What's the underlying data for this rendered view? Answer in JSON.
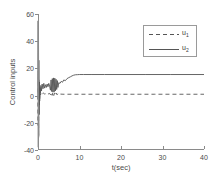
{
  "chart_data": {
    "type": "line",
    "title": "",
    "xlabel": "t(sec)",
    "ylabel": "Control inputs",
    "xlim": [
      0,
      40
    ],
    "ylim": [
      -40,
      60
    ],
    "xticks": [
      "0",
      "10",
      "20",
      "30",
      "40"
    ],
    "xtick_values": [
      0,
      10,
      20,
      30,
      40
    ],
    "yticks": [
      "-40",
      "-20",
      "0",
      "20",
      "40",
      "60"
    ],
    "ytick_values": [
      -40,
      -20,
      0,
      20,
      40,
      60
    ],
    "grid": false,
    "legend_position": "upper right",
    "series": [
      {
        "name": "u_1",
        "label": "u",
        "sublabel": "1",
        "style": "dashed",
        "color": "#555555",
        "steady_state": 1.0,
        "x": [
          0,
          0.05,
          0.1,
          0.15,
          0.2,
          0.25,
          0.3,
          0.4,
          0.5,
          0.6,
          0.8,
          1.0,
          1.3,
          1.6,
          2.0,
          2.4,
          2.8,
          3.0,
          3.2,
          3.4,
          3.6,
          3.8,
          4.0,
          4.2,
          4.4,
          4.6,
          4.8,
          5.0,
          5.4,
          6.0,
          7.0,
          8.0,
          10.0,
          14.0,
          20.0,
          28.0,
          34.0,
          40.0
        ],
        "y": [
          0,
          -22,
          18,
          -31,
          12,
          -8,
          5,
          -3,
          2.5,
          0.5,
          2.2,
          1.2,
          2.0,
          1.0,
          1.8,
          1.1,
          1.6,
          0.6,
          2.2,
          0.2,
          2.4,
          0.1,
          2.0,
          0.4,
          1.8,
          0.6,
          1.5,
          1.0,
          1.1,
          1.0,
          1.0,
          1.0,
          1.0,
          1.0,
          1.0,
          1.0,
          1.0,
          1.0
        ]
      },
      {
        "name": "u_2",
        "label": "u",
        "sublabel": "2",
        "style": "solid",
        "color": "#555555",
        "steady_state": 15.5,
        "x": [
          0,
          0.04,
          0.08,
          0.12,
          0.16,
          0.2,
          0.26,
          0.32,
          0.4,
          0.5,
          0.6,
          0.7,
          0.85,
          1.0,
          1.2,
          1.4,
          1.6,
          1.8,
          2.0,
          2.2,
          2.4,
          2.6,
          2.8,
          3.0,
          3.15,
          3.3,
          3.45,
          3.6,
          3.75,
          3.9,
          4.05,
          4.2,
          4.35,
          4.5,
          4.65,
          4.8,
          5.0,
          5.3,
          5.6,
          5.9,
          6.2,
          6.6,
          7.0,
          7.4,
          7.8,
          8.2,
          8.6,
          9.0,
          9.5,
          10.0,
          11.0,
          13.0,
          16.0,
          20.0,
          26.0,
          32.0,
          40.0
        ],
        "y": [
          0,
          55,
          -38,
          44,
          -30,
          26,
          -14,
          10,
          -4,
          6,
          2,
          7.5,
          3.5,
          8.5,
          5.0,
          9.0,
          5.5,
          8.0,
          6.0,
          8.5,
          6.5,
          9.0,
          7.0,
          4.0,
          11.5,
          3.0,
          12.5,
          2.5,
          13.0,
          2.8,
          12.8,
          3.5,
          12.0,
          4.5,
          11.0,
          6.0,
          9.5,
          9.0,
          10.5,
          9.8,
          11.5,
          11.0,
          12.5,
          13.2,
          13.8,
          14.5,
          15.0,
          15.3,
          15.4,
          15.5,
          15.5,
          15.5,
          15.5,
          15.5,
          15.5,
          15.5,
          15.5
        ]
      }
    ]
  },
  "axes": {
    "line_color": "#8a8a8a"
  }
}
